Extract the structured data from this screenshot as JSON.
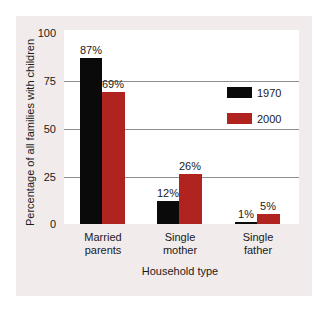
{
  "chart_data": {
    "type": "bar",
    "title": "",
    "xlabel": "Household type",
    "ylabel": "Percentage of all families with children",
    "categories": [
      "Married parents",
      "Single mother",
      "Single father"
    ],
    "category_lines": [
      [
        "Married",
        "parents"
      ],
      [
        "Single",
        "mother"
      ],
      [
        "Single",
        "father"
      ]
    ],
    "series": [
      {
        "name": "1970",
        "color": "#0a0a0a",
        "values": [
          87,
          12,
          1
        ],
        "labels": [
          "87%",
          "12%",
          "1%"
        ]
      },
      {
        "name": "2000",
        "color": "#b0231f",
        "values": [
          69,
          26,
          5
        ],
        "labels": [
          "69%",
          "26%",
          "5%"
        ]
      }
    ],
    "ylim": [
      0,
      100
    ],
    "yticks": [
      "0",
      "25",
      "50",
      "75",
      "100"
    ],
    "grid": true,
    "gridlines_at": [
      25,
      50,
      75
    ],
    "legend_position": "upper right inside plot"
  }
}
